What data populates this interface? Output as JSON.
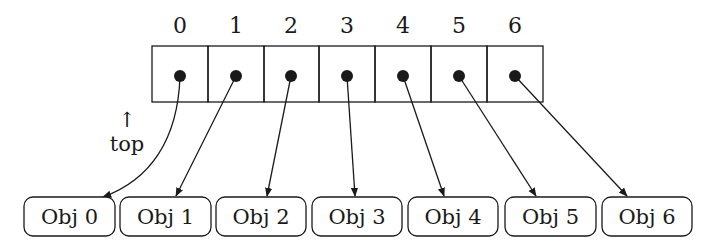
{
  "diagram": {
    "type": "array-of-pointers",
    "array": {
      "indices": [
        "0",
        "1",
        "2",
        "3",
        "4",
        "5",
        "6"
      ],
      "cell_count": 7
    },
    "objects": [
      "Obj 0",
      "Obj 1",
      "Obj 2",
      "Obj 3",
      "Obj 4",
      "Obj 5",
      "Obj 6"
    ],
    "top_marker": {
      "arrow": "↑",
      "label": "top"
    },
    "colors": {
      "stroke": "#1a1a1a",
      "background": "#ffffff"
    }
  }
}
